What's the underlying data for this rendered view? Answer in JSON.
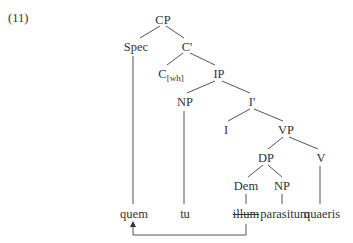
{
  "example_number": "(11)",
  "tree": {
    "nodes": {
      "cp": "CP",
      "spec": "Spec",
      "c_bar": "C'",
      "c_head": "C",
      "c_feature": "[wh]",
      "ip": "IP",
      "np_subject": "NP",
      "i_bar": "I'",
      "i_head": "I",
      "vp": "VP",
      "dp": "DP",
      "v": "V",
      "dem": "Dem",
      "np_object": "NP"
    },
    "words": {
      "quem": "quem",
      "tu": "tu",
      "illum": "illum",
      "parasitum": "parasitum",
      "quaeris": "quaeris"
    },
    "struck_word": "illum",
    "movement_arrow": {
      "from": "illum",
      "to": "quem"
    }
  }
}
